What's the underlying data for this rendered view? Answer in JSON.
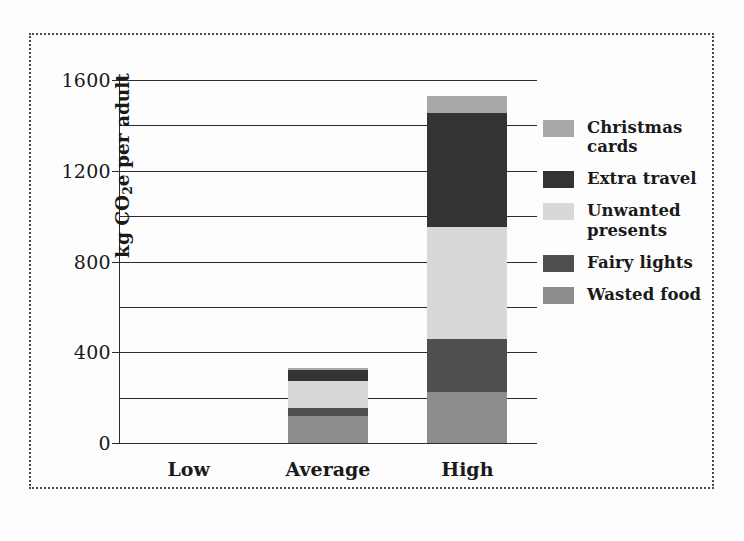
{
  "chart_data": {
    "type": "bar",
    "subtype": "stacked-vertical",
    "title": "",
    "subtitle": "",
    "xlabel": "",
    "ylabel": "kg CO2e per adult",
    "ylabel_parts": {
      "prefix": "kg CO",
      "sub": "2",
      "suffix": "e per adult"
    },
    "categories": [
      "Low",
      "Average",
      "High"
    ],
    "ylim": [
      0,
      1600
    ],
    "yticks": [
      0,
      400,
      800,
      1200,
      1600
    ],
    "ytick_labels": [
      "0",
      "400",
      "800",
      "1200",
      "1600"
    ],
    "minor_gridlines": [
      200,
      600,
      1000,
      1400
    ],
    "grid": true,
    "grid_axis": "y",
    "legend_position": "right",
    "series": [
      {
        "name": "Wasted food",
        "color": "#8c8c8c",
        "values": [
          0,
          120,
          225
        ]
      },
      {
        "name": "Fairy lights",
        "color": "#4f4f4f",
        "values": [
          0,
          35,
          234
        ]
      },
      {
        "name": "Unwanted presents",
        "color": "#d8d8d8",
        "values": [
          0,
          120,
          493
        ]
      },
      {
        "name": "Extra travel",
        "color": "#333333",
        "values": [
          0,
          45,
          503
        ]
      },
      {
        "name": "Christmas cards",
        "color": "#a8a8a8",
        "values": [
          0,
          10,
          75
        ]
      }
    ],
    "legend_order": [
      "Christmas cards",
      "Extra travel",
      "Unwanted presents",
      "Fairy lights",
      "Wasted food"
    ],
    "totals": [
      0,
      330,
      1530
    ],
    "units": "kg CO2e per adult"
  },
  "legend": {
    "items": [
      {
        "label": "Christmas cards",
        "color": "#a8a8a8"
      },
      {
        "label": "Extra travel",
        "color": "#333333"
      },
      {
        "label": "Unwanted presents",
        "color": "#d8d8d8"
      },
      {
        "label": "Fairy lights",
        "color": "#4f4f4f"
      },
      {
        "label": "Wasted food",
        "color": "#8c8c8c"
      }
    ]
  },
  "style": {
    "axis_color": "#2b2b2b",
    "grid_color": "#2b2b2b",
    "border_color": "#4a4a4a",
    "background": "#fdfdfd",
    "text_color": "#1a1a1a"
  }
}
